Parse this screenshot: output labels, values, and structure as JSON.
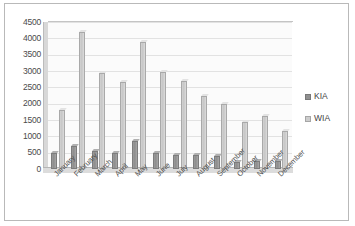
{
  "chart_data": {
    "type": "bar",
    "title": "",
    "subtitle": "",
    "xlabel": "",
    "ylabel": "",
    "categories": [
      "January",
      "February",
      "March",
      "April",
      "May",
      "June",
      "July",
      "August",
      "September",
      "October",
      "November",
      "December"
    ],
    "series": [
      {
        "name": "KIA",
        "color": "#909090",
        "values": [
          500,
          700,
          550,
          500,
          850,
          480,
          430,
          420,
          410,
          220,
          260,
          260
        ]
      },
      {
        "name": "WIA",
        "color": "#cdcdcd",
        "values": [
          1800,
          4200,
          2950,
          2650,
          3900,
          2980,
          2700,
          2250,
          2000,
          1450,
          1620,
          1150
        ]
      }
    ],
    "ylim": [
      0,
      4500
    ],
    "y_ticks": [
      0,
      500,
      1000,
      1500,
      2000,
      2500,
      3000,
      3500,
      4000,
      4500
    ],
    "y_tick_labels": [
      "0",
      "500",
      "1000",
      "1500",
      "2000",
      "2500",
      "3000",
      "3500",
      "4000",
      "4500"
    ],
    "grid": true,
    "legend_position": "right",
    "legend_entries": [
      "KIA",
      "WIA"
    ]
  },
  "legend": {
    "items": [
      {
        "label": "KIA",
        "swatch": "kia"
      },
      {
        "label": "WIA",
        "swatch": "wia"
      }
    ]
  }
}
